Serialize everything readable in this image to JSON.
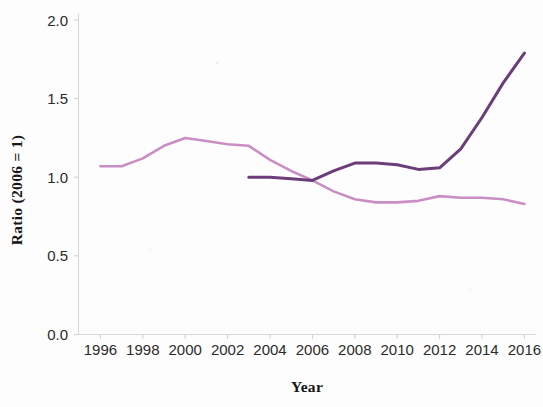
{
  "chart_data": {
    "type": "line",
    "title": "",
    "xlabel": "Year",
    "ylabel": "Ratio (2006 = 1)",
    "xlim": [
      1995,
      2017
    ],
    "ylim": [
      0.0,
      2.0
    ],
    "grid": false,
    "legend": "none",
    "x_ticks": [
      1996,
      1998,
      2000,
      2002,
      2004,
      2006,
      2008,
      2010,
      2012,
      2014,
      2016
    ],
    "x_tick_labels": [
      "1996",
      "1998",
      "2000",
      "2002",
      "2004",
      "2006",
      "2008",
      "2010",
      "2012",
      "2014",
      "2016"
    ],
    "y_ticks": [
      0.0,
      0.5,
      1.0,
      1.5,
      2.0
    ],
    "y_tick_labels": [
      "0.0",
      "0.5",
      "1.0",
      "1.5",
      "2.0"
    ],
    "series": [
      {
        "name": "light-orchid-series",
        "color": "#c98fc4",
        "stroke_width": 2.6,
        "x": [
          1996,
          1997,
          1998,
          1999,
          2000,
          2001,
          2002,
          2003,
          2004,
          2005,
          2006,
          2007,
          2008,
          2009,
          2010,
          2011,
          2012,
          2013,
          2014,
          2015,
          2016
        ],
        "values": [
          1.07,
          1.07,
          1.12,
          1.2,
          1.25,
          1.23,
          1.21,
          1.2,
          1.11,
          1.04,
          0.98,
          0.91,
          0.86,
          0.84,
          0.84,
          0.85,
          0.88,
          0.87,
          0.87,
          0.86,
          0.83
        ]
      },
      {
        "name": "dark-purple-series",
        "color": "#6b3d7a",
        "stroke_width": 3.0,
        "x": [
          2003,
          2004,
          2005,
          2006,
          2007,
          2008,
          2009,
          2010,
          2011,
          2012,
          2013,
          2014,
          2015,
          2016
        ],
        "values": [
          1.0,
          1.0,
          0.99,
          0.98,
          1.04,
          1.09,
          1.09,
          1.08,
          1.05,
          1.06,
          1.18,
          1.38,
          1.6,
          1.79
        ]
      }
    ]
  },
  "axes": {
    "y_axis_title": "Ratio (2006 = 1)",
    "x_axis_title": "Year"
  }
}
